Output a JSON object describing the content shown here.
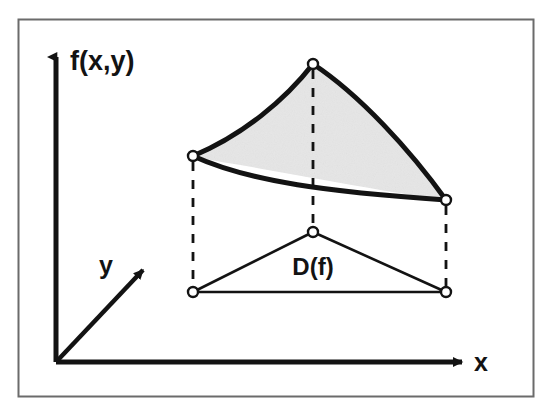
{
  "figure": {
    "background_color": "#ffffff",
    "frame": {
      "name": "outer-frame",
      "color": "#6b6b6b",
      "x": 18,
      "y": 19,
      "width": 515,
      "height": 377
    },
    "axes": {
      "origin": {
        "x": 56,
        "y": 362
      },
      "color": "#131313",
      "vertical": {
        "label": "f(x,y)",
        "from": {
          "x": 56,
          "y": 362
        },
        "to": {
          "x": 56,
          "y": 57
        },
        "label_pos": {
          "x": 70,
          "y": 70
        }
      },
      "horizontal": {
        "label": "x",
        "from": {
          "x": 56,
          "y": 362
        },
        "to": {
          "x": 462,
          "y": 362
        },
        "label_pos": {
          "x": 474,
          "y": 371
        }
      },
      "depth": {
        "label": "y",
        "from": {
          "x": 56,
          "y": 362
        },
        "to": {
          "x": 143,
          "y": 270
        },
        "label_pos": {
          "x": 106,
          "y": 274
        }
      }
    },
    "surface": {
      "name": "function-graph-patch",
      "fill_color": "#e6e6e6",
      "stroke_color": "#131313",
      "vertices": [
        {
          "name": "surface-vertex-left",
          "x": 193,
          "y": 156
        },
        {
          "name": "surface-vertex-top",
          "x": 313,
          "y": 64
        },
        {
          "name": "surface-vertex-right",
          "x": 446,
          "y": 200
        }
      ],
      "edges": [
        {
          "name": "edge-left-top",
          "type": "curve",
          "bulge": "concave"
        },
        {
          "name": "edge-top-right",
          "type": "curve",
          "bulge": "convex"
        },
        {
          "name": "edge-left-right",
          "type": "curve",
          "bulge": "sag"
        }
      ]
    },
    "domain": {
      "name": "domain-triangle",
      "label": "D(f)",
      "label_pos": {
        "x": 313,
        "y": 275
      },
      "stroke_color": "#131313",
      "fill_color": "#ffffff",
      "vertices": [
        {
          "name": "domain-vertex-apex",
          "x": 313,
          "y": 232
        },
        {
          "name": "domain-vertex-bottom-left",
          "x": 193,
          "y": 292
        },
        {
          "name": "domain-vertex-bottom-right",
          "x": 446,
          "y": 292
        }
      ]
    },
    "projection_lines": [
      {
        "name": "projector-left",
        "x": 193,
        "y1": 162,
        "y2": 286
      },
      {
        "name": "projector-center",
        "x": 313,
        "y1": 70,
        "y2": 226
      },
      {
        "name": "projector-right",
        "x": 446,
        "y1": 206,
        "y2": 286
      }
    ]
  }
}
